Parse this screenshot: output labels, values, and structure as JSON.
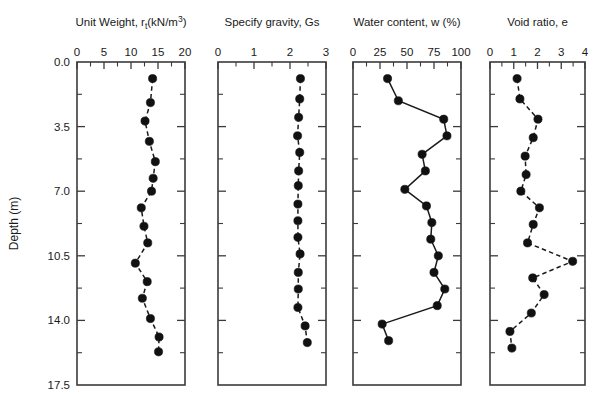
{
  "figure": {
    "y_axis_title": "Depth (m)",
    "depth_ticks": [
      "0.0",
      "3.5",
      "7.0",
      "10.5",
      "14.0",
      "17.5"
    ],
    "depth_range": [
      0,
      17.5
    ]
  },
  "chart_data": [
    {
      "type": "line",
      "title": "Unit Weight, r",
      "title_sub": "t",
      "title_rest": "(kN/m",
      "title_sup": "3",
      "title_tail": ")",
      "title_full": "Unit Weight, rt(kN/m3)",
      "xlabel": "Unit Weight, rt (kN/m3)",
      "ylabel": "Depth (m)",
      "xlim": [
        0,
        20
      ],
      "ylim": [
        0,
        17.5
      ],
      "xticks": [
        0,
        5,
        10,
        15,
        20
      ],
      "xticklabels": [
        "0",
        "5",
        "10",
        "15",
        "20"
      ],
      "minor_xticks": [
        2.5,
        7.5,
        12.5,
        17.5
      ],
      "grid": false,
      "linestyle": "dashed",
      "marker": "filled-circle",
      "x": [
        14.0,
        13.6,
        12.6,
        13.4,
        14.5,
        14.1,
        13.8,
        11.9,
        12.4,
        13.1,
        10.8,
        13.0,
        12.1,
        13.6,
        15.2,
        15.1
      ],
      "y": [
        0.9,
        2.2,
        3.2,
        4.3,
        5.4,
        6.3,
        7.0,
        7.9,
        8.9,
        9.8,
        10.9,
        11.9,
        12.8,
        13.9,
        14.9,
        15.7
      ]
    },
    {
      "type": "line",
      "title_full": "Specify gravity, Gs",
      "xlabel": "Specify gravity, Gs",
      "ylabel": "Depth (m)",
      "xlim": [
        0,
        3
      ],
      "ylim": [
        0,
        17.5
      ],
      "xticks": [
        0,
        1,
        2,
        3
      ],
      "xticklabels": [
        "0",
        "1",
        "2",
        "3"
      ],
      "minor_xticks": [
        0.5,
        1.5,
        2.5
      ],
      "grid": false,
      "linestyle": "dashed",
      "marker": "filled-circle",
      "x": [
        2.29,
        2.27,
        2.24,
        2.21,
        2.27,
        2.24,
        2.23,
        2.22,
        2.22,
        2.22,
        2.28,
        2.23,
        2.23,
        2.22,
        2.42,
        2.48
      ],
      "y": [
        0.9,
        2.0,
        3.0,
        4.0,
        4.9,
        5.9,
        6.7,
        7.7,
        8.6,
        9.5,
        10.4,
        11.4,
        12.3,
        13.3,
        14.3,
        15.2
      ]
    },
    {
      "type": "line",
      "title_full": "Water content, w (%)",
      "xlabel": "Water content, w (%)",
      "ylabel": "Depth (m)",
      "xlim": [
        0,
        100
      ],
      "ylim": [
        0,
        17.5
      ],
      "xticks": [
        0,
        25,
        50,
        75,
        100
      ],
      "xticklabels": [
        "0",
        "25",
        "50",
        "75",
        "100"
      ],
      "minor_xticks": [
        12.5,
        37.5,
        62.5,
        87.5
      ],
      "grid": false,
      "linestyle": "solid",
      "marker": "filled-circle",
      "x": [
        32,
        42,
        84,
        87,
        64,
        67,
        48,
        68,
        73,
        72,
        79,
        75,
        85,
        78,
        27,
        33
      ],
      "y": [
        0.9,
        2.1,
        3.1,
        4.0,
        5.0,
        5.9,
        6.9,
        7.8,
        8.7,
        9.6,
        10.5,
        11.4,
        12.3,
        13.2,
        14.2,
        15.1
      ]
    },
    {
      "type": "line",
      "title_full": "Void ratio, e",
      "xlabel": "Void ratio, e",
      "ylabel": "Depth (m)",
      "xlim": [
        0,
        4
      ],
      "ylim": [
        0,
        17.5
      ],
      "xticks": [
        0,
        1,
        2,
        3,
        4
      ],
      "xticklabels": [
        "0",
        "1",
        "2",
        "3",
        "4"
      ],
      "minor_xticks": [
        0.5,
        1.5,
        2.5,
        3.5
      ],
      "grid": false,
      "linestyle": "dashed",
      "marker": "filled-circle",
      "x": [
        1.14,
        1.26,
        2.02,
        1.82,
        1.48,
        1.52,
        1.3,
        2.08,
        1.82,
        1.58,
        3.48,
        1.8,
        2.28,
        1.74,
        0.84,
        0.92
      ],
      "y": [
        0.9,
        2.0,
        3.1,
        4.1,
        5.1,
        6.1,
        7.0,
        7.9,
        8.8,
        9.8,
        10.8,
        11.7,
        12.6,
        13.6,
        14.6,
        15.5
      ]
    }
  ],
  "colors": {
    "line": "#1a1a1a",
    "marker": "#111111",
    "axis": "#3b3b3b",
    "background": "#ffffff"
  }
}
